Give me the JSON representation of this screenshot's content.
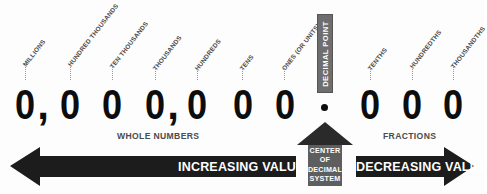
{
  "diagram": {
    "number_string": "0,000,000.000",
    "digits": [
      "0",
      "0",
      "0",
      "0",
      "0",
      "0",
      "0",
      "0",
      "0",
      "0"
    ],
    "commas": [
      ",",
      ","
    ],
    "decimal_point_glyph": "."
  },
  "place_labels": [
    {
      "text": "MILLIONS",
      "side": "whole"
    },
    {
      "text": "HUNDRED THOUSANDS",
      "side": "whole"
    },
    {
      "text": "TEN THOUSANDS",
      "side": "whole"
    },
    {
      "text": "THOUSANDS",
      "side": "whole"
    },
    {
      "text": "HUNDREDS",
      "side": "whole"
    },
    {
      "text": "TENS",
      "side": "whole"
    },
    {
      "text": "ONES (OR UNITS)",
      "side": "whole"
    },
    {
      "text": "TENTHS",
      "side": "fraction"
    },
    {
      "text": "HUNDREDTHS",
      "side": "fraction"
    },
    {
      "text": "THOUSANDTHS",
      "side": "fraction"
    }
  ],
  "decimal_point": {
    "label": "DECIMAL POINT",
    "box_color": "#6e6e6e",
    "text_color": "#ffffff"
  },
  "captions": {
    "left": "WHOLE NUMBERS",
    "right": "FRACTIONS",
    "color": "#4b4b4b"
  },
  "arrows": {
    "left": {
      "label": "INCREASING VALUE",
      "direction": "left",
      "color": "#1c1c1c",
      "text_color": "#ffffff"
    },
    "right": {
      "label": "DECREASING VALUE",
      "direction": "right",
      "color": "#1c1c1c",
      "text_color": "#ffffff"
    },
    "center": {
      "line1": "CENTER",
      "line2": "OF",
      "line3": "DECIMAL",
      "line4": "SYSTEM",
      "direction": "up",
      "head_color": "#2a2a2a",
      "body_color": "#5e5e5e",
      "text_color": "#ffffff"
    }
  },
  "colors": {
    "background": "#fdfdfd",
    "digit": "#0d0d0d",
    "label": "#4a4a4a",
    "leader": "#9a9a9a"
  }
}
